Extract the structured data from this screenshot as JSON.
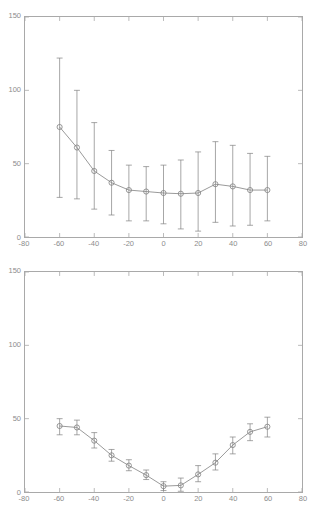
{
  "figure": {
    "background": "#ffffff",
    "axis_color": "#a9a9a9",
    "tick_label_color": "#8c8c8c",
    "data_color": "#808080",
    "width": 320,
    "height": 519
  },
  "chart_data": [
    {
      "id": "top-panel",
      "type": "line",
      "title": "",
      "xlabel": "",
      "ylabel": "",
      "xlim": [
        -80,
        80
      ],
      "ylim": [
        0,
        150
      ],
      "xticks": [
        -80,
        -60,
        -40,
        -20,
        0,
        20,
        40,
        60,
        80
      ],
      "xticklabels": [
        "-80",
        "-60",
        "-40",
        "-20",
        "0",
        "20",
        "40",
        "60",
        "80"
      ],
      "yticks": [
        0,
        50,
        100,
        150
      ],
      "yticklabels": [
        "0",
        "50",
        "100",
        "150"
      ],
      "grid": false,
      "legend": null,
      "marker": "circle",
      "errorbars": true,
      "x": [
        -60,
        -50,
        -40,
        -30,
        -20,
        -10,
        0,
        10,
        20,
        30,
        40,
        50,
        60
      ],
      "values": [
        75,
        61,
        45,
        37,
        32,
        31,
        30,
        29.5,
        30,
        36,
        34.5,
        32,
        32
      ],
      "err_low": [
        48,
        35,
        26,
        22,
        21,
        20,
        21,
        24,
        26,
        26,
        27,
        24,
        21
      ],
      "err_high": [
        47,
        39,
        33,
        22,
        17,
        17,
        19,
        23,
        28,
        29,
        28,
        25,
        23
      ]
    },
    {
      "id": "bottom-panel",
      "type": "line",
      "title": "",
      "xlabel": "",
      "ylabel": "",
      "xlim": [
        -80,
        80
      ],
      "ylim": [
        0,
        150
      ],
      "xticks": [
        -80,
        -60,
        -40,
        -20,
        0,
        20,
        40,
        60,
        80
      ],
      "xticklabels": [
        "-80",
        "-60",
        "-40",
        "-20",
        "0",
        "20",
        "40",
        "60",
        "80"
      ],
      "yticks": [
        0,
        50,
        100,
        150
      ],
      "yticklabels": [
        "0",
        "50",
        "100",
        "150"
      ],
      "grid": false,
      "legend": null,
      "marker": "circle",
      "errorbars": true,
      "x": [
        -60,
        -50,
        -40,
        -30,
        -20,
        -10,
        0,
        10,
        20,
        30,
        40,
        50,
        60
      ],
      "values": [
        45,
        44,
        35,
        25,
        18,
        11.5,
        4,
        4.5,
        12,
        20,
        32,
        41,
        44.5
      ],
      "err_low": [
        6,
        5,
        5,
        4,
        3.5,
        3,
        3,
        4,
        5,
        5,
        6,
        6,
        7
      ],
      "err_high": [
        5,
        5,
        5.5,
        4,
        4,
        3.5,
        3,
        5,
        6,
        6,
        5.5,
        5.5,
        6.5
      ]
    }
  ]
}
